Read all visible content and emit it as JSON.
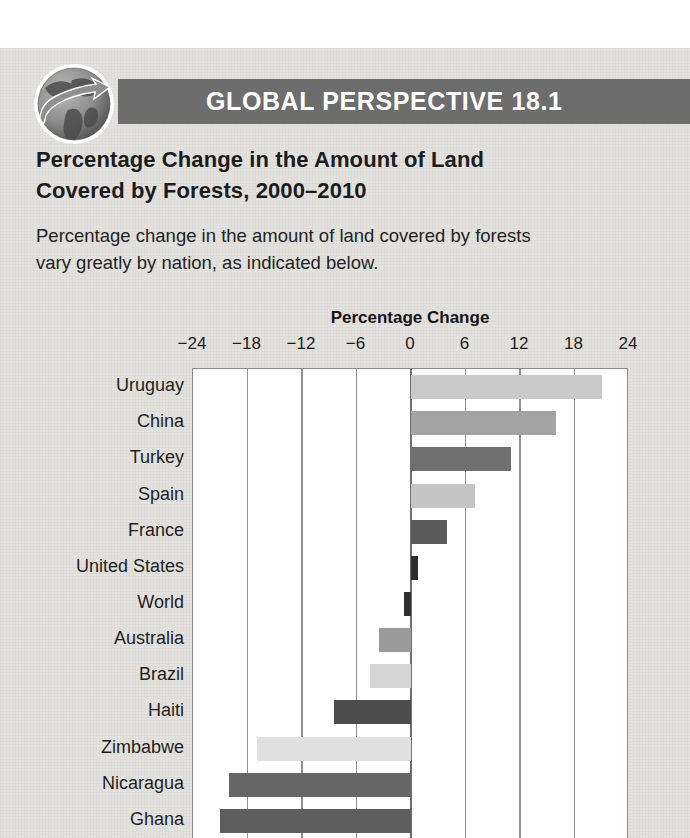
{
  "banner": {
    "title": "GLOBAL PERSPECTIVE 18.1",
    "icon": "globe-with-arrow-icon",
    "background_color": "#6d6d6d",
    "text_color": "#ffffff"
  },
  "page": {
    "background_color": "#e3e2df",
    "margin_color": "#ffffff"
  },
  "heading": {
    "line1": "Percentage Change in the Amount of Land",
    "line2": "Covered by Forests, 2000–2010"
  },
  "lead": {
    "line1": "Percentage change in the amount of land covered by forests",
    "line2": "vary greatly by nation, as indicated below."
  },
  "chart_data": {
    "type": "bar",
    "orientation": "horizontal",
    "title": "Percentage Change",
    "xlabel": "Percentage Change",
    "ylabel": "",
    "xlim": [
      -24,
      24
    ],
    "xticks": [
      -24,
      -18,
      -12,
      -6,
      0,
      6,
      12,
      18,
      24
    ],
    "xtick_labels": [
      "−24",
      "−18",
      "−12",
      "−6",
      "0",
      "6",
      "12",
      "18",
      "24"
    ],
    "grid": true,
    "legend": "none",
    "categories": [
      "Uruguay",
      "China",
      "Turkey",
      "Spain",
      "France",
      "United States",
      "World",
      "Australia",
      "Brazil",
      "Haiti",
      "Zimbabwe",
      "Nicaragua",
      "Ghana"
    ],
    "values": [
      21.0,
      16.0,
      11.0,
      7.0,
      4.0,
      0.8,
      -0.8,
      -3.5,
      -4.5,
      -8.5,
      -17.0,
      -20.0,
      -21.0
    ],
    "bar_colors": [
      "#c9c9c9",
      "#a3a3a3",
      "#6f6f6f",
      "#c5c5c5",
      "#5a5a5a",
      "#2f2f2f",
      "#2f2f2f",
      "#9a9a9a",
      "#d5d5d5",
      "#4c4c4c",
      "#e0e0e0",
      "#666666",
      "#5e5e5e"
    ],
    "plot_background": "#ffffff",
    "axis_color": "#8f8f8f"
  }
}
